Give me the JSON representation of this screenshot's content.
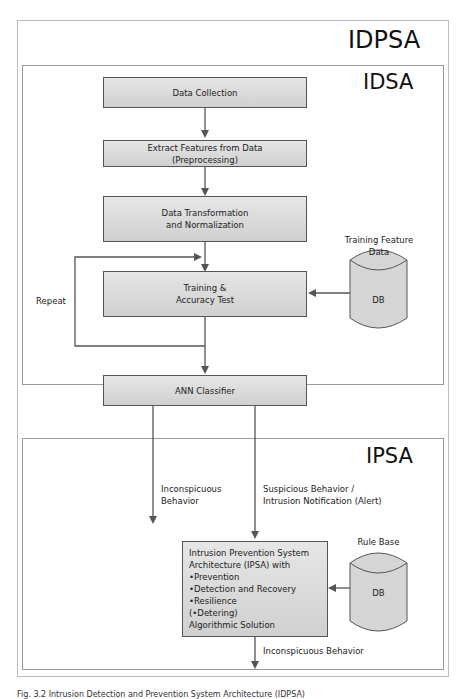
{
  "outer": {
    "title": "IDPSA"
  },
  "idsa": {
    "title": "IDSA",
    "steps": [
      {
        "label": "Data Collection"
      },
      {
        "label": "Extract Features from Data\n(Preprocessing)"
      },
      {
        "label": "Data Transformation\nand Normalization"
      },
      {
        "label": "Training &\nAccuracy Test"
      },
      {
        "label": "ANN Classifier"
      }
    ],
    "repeat_label": "Repeat",
    "db": {
      "caption": "Training Feature\nData",
      "label": "DB"
    }
  },
  "ipsa": {
    "title": "IPSA",
    "inconspicuous_label": "Inconspicuous\nBehavior",
    "suspicious_label": "Suspicious Behavior /\nIntrusion Notification (Alert)",
    "system_box": "Intrusion Prevention System\nArchitecture (IPSA) with\n•Prevention\n•Detection and Recovery\n•Resilience\n(•Detering)\nAlgorithmic Solution",
    "db": {
      "caption": "Rule Base",
      "label": "DB"
    },
    "output_label": "Inconspicuous Behavior"
  },
  "caption": "Fig. 3.2 Intrusion Detection and Prevention System Architecture (IDPSA)"
}
